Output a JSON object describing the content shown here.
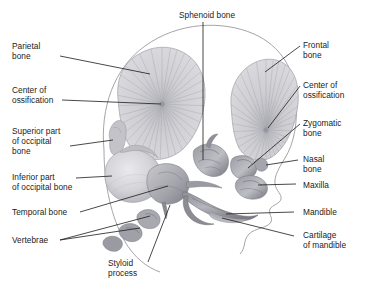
{
  "figure": {
    "colors": {
      "background": "#ffffff",
      "leader_line": "#1b1b1b",
      "skull_outline": "#8e8e96",
      "bone_light": "#d2d2d6",
      "bone_mid": "#a9a9b0",
      "bone_dark": "#6f6f77",
      "text": "#1b1b1b"
    }
  },
  "labels": {
    "sphenoid_bone": "Sphenoid bone",
    "parietal_bone": "Parietal\nbone",
    "center_of_ossification_left": "Center of\nossification",
    "superior_part_of_occipital_bone": "Superior part\nof occipital\nbone",
    "inferior_part_of_occipital_bone": "Inferior part\nof occipital bone",
    "temporal_bone": "Temporal bone",
    "vertebrae": "Vertebrae",
    "styloid_process": "Styloid\nprocess",
    "frontal_bone": "Frontal\nbone",
    "center_of_ossification_right": "Center of\nossification",
    "zygomatic_bone": "Zygomatic\nbone",
    "nasal_bone": "Nasal\nbone",
    "maxilla": "Maxilla",
    "mandible": "Mandible",
    "cartilage_of_mandible": "Cartilage\nof mandible"
  }
}
